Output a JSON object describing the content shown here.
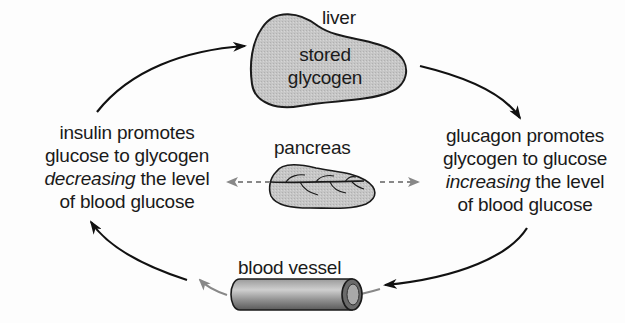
{
  "diagram": {
    "type": "cycle",
    "title": "",
    "nodes": {
      "liver": {
        "label": "liver",
        "content_line1": "stored",
        "content_line2": "glycogen"
      },
      "pancreas": {
        "label": "pancreas"
      },
      "blood_vessel": {
        "label": "blood vessel"
      }
    },
    "left_text": {
      "line1": "insulin promotes",
      "line2": "glucose to glycogen",
      "line3_italic": "decreasing",
      "line3_rest": " the level",
      "line4": "of blood glucose"
    },
    "right_text": {
      "line1": "glucagon promotes",
      "line2": "glycogen to glucose",
      "line3_italic": "increasing",
      "line3_rest": " the level",
      "line4": "of blood glucose"
    },
    "arrows": [
      {
        "from": "insulin text",
        "to": "liver",
        "style": "solid-black"
      },
      {
        "from": "liver",
        "to": "glucagon text",
        "style": "solid-black"
      },
      {
        "from": "glucagon text",
        "to": "blood vessel",
        "style": "solid-black"
      },
      {
        "from": "blood vessel",
        "to": "insulin text",
        "style": "solid-black + gray"
      },
      {
        "from": "pancreas",
        "to": "insulin text",
        "style": "dashed-gray"
      },
      {
        "from": "pancreas",
        "to": "glucagon text",
        "style": "dashed-gray"
      }
    ],
    "colors": {
      "organ_fill": "#c4c4c4",
      "outline": "#1a1a1a",
      "gray_arrow": "#8a8a8a",
      "background": "#fdfdfd"
    }
  }
}
